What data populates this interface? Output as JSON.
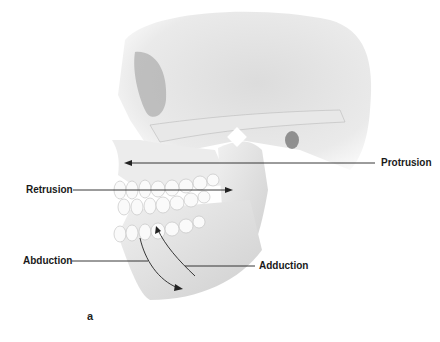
{
  "figure": {
    "panel_label": "a"
  },
  "labels": {
    "protrusion": "Protrusion",
    "retrusion": "Retrusion",
    "abduction": "Abduction",
    "adduction": "Adduction"
  },
  "colors": {
    "bone_light": "#f2f2f2",
    "bone_mid": "#d6d6d6",
    "bone_shadow": "#a8a8a8",
    "line": "#222222",
    "text": "#1a1a1a"
  }
}
